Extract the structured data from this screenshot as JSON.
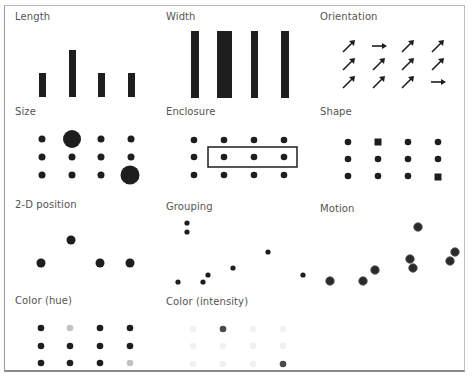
{
  "panels": [
    {
      "id": "length",
      "title": "Length",
      "title_pos": [
        15,
        11
      ]
    },
    {
      "id": "width",
      "title": "Width",
      "title_pos": [
        166,
        11
      ]
    },
    {
      "id": "orientation",
      "title": "Orientation",
      "title_pos": [
        320,
        11
      ]
    },
    {
      "id": "size",
      "title": "Size",
      "title_pos": [
        15,
        106
      ]
    },
    {
      "id": "enclosure",
      "title": "Enclosure",
      "title_pos": [
        166,
        106
      ]
    },
    {
      "id": "shape",
      "title": "Shape",
      "title_pos": [
        320,
        106
      ]
    },
    {
      "id": "position",
      "title": "2-D position",
      "title_pos": [
        15,
        199
      ]
    },
    {
      "id": "grouping",
      "title": "Grouping",
      "title_pos": [
        166,
        201
      ]
    },
    {
      "id": "motion",
      "title": "Motion",
      "title_pos": [
        320,
        203
      ]
    },
    {
      "id": "color-hue",
      "title": "Color (hue)",
      "title_pos": [
        15,
        295
      ]
    },
    {
      "id": "color-intensity",
      "title": "Color (intensity)",
      "title_pos": [
        166,
        296
      ]
    }
  ],
  "colors": {
    "mark": "#1e1e1e",
    "hue_light": "#c2c2c2",
    "intensity_faint": "#f1f1f1",
    "intensity_dark": "#4a4a4a",
    "border": "#9a9a9a"
  },
  "marks": {
    "length_bars": [
      {
        "x": 39,
        "y": 73,
        "w": 7,
        "h": 24
      },
      {
        "x": 69,
        "y": 50,
        "w": 7,
        "h": 47
      },
      {
        "x": 98,
        "y": 73,
        "w": 7,
        "h": 24
      },
      {
        "x": 128,
        "y": 73,
        "w": 7,
        "h": 24
      }
    ],
    "width_bars": [
      {
        "x": 191,
        "y": 31,
        "w": 8,
        "h": 67
      },
      {
        "x": 217,
        "y": 31,
        "w": 15,
        "h": 67
      },
      {
        "x": 251,
        "y": 31,
        "w": 7,
        "h": 67
      },
      {
        "x": 281,
        "y": 31,
        "w": 8,
        "h": 67
      }
    ],
    "orientation_arrows": [
      {
        "cx": 349,
        "cy": 46,
        "dir": "diag"
      },
      {
        "cx": 379,
        "cy": 46,
        "dir": "right"
      },
      {
        "cx": 408,
        "cy": 46,
        "dir": "diag"
      },
      {
        "cx": 438,
        "cy": 46,
        "dir": "diag"
      },
      {
        "cx": 349,
        "cy": 64,
        "dir": "diag"
      },
      {
        "cx": 379,
        "cy": 64,
        "dir": "diag"
      },
      {
        "cx": 408,
        "cy": 64,
        "dir": "diag"
      },
      {
        "cx": 438,
        "cy": 64,
        "dir": "diag"
      },
      {
        "cx": 349,
        "cy": 82,
        "dir": "diag"
      },
      {
        "cx": 379,
        "cy": 82,
        "dir": "diag"
      },
      {
        "cx": 408,
        "cy": 82,
        "dir": "diag"
      },
      {
        "cx": 438,
        "cy": 82,
        "dir": "right"
      }
    ],
    "size_dots": [
      {
        "cx": 42,
        "cy": 139,
        "r": 3.5
      },
      {
        "cx": 72,
        "cy": 139,
        "r": 9
      },
      {
        "cx": 101,
        "cy": 139,
        "r": 3.5
      },
      {
        "cx": 131,
        "cy": 139,
        "r": 3.5
      },
      {
        "cx": 42,
        "cy": 157,
        "r": 3.5
      },
      {
        "cx": 72,
        "cy": 157,
        "r": 3.5
      },
      {
        "cx": 101,
        "cy": 157,
        "r": 3.5
      },
      {
        "cx": 131,
        "cy": 157,
        "r": 3.5
      },
      {
        "cx": 42,
        "cy": 175,
        "r": 3.5
      },
      {
        "cx": 72,
        "cy": 175,
        "r": 3.5
      },
      {
        "cx": 101,
        "cy": 175,
        "r": 3.5
      },
      {
        "cx": 130,
        "cy": 175,
        "r": 9.5
      }
    ],
    "enclosure_dots": [
      {
        "cx": 194,
        "cy": 140
      },
      {
        "cx": 224,
        "cy": 140
      },
      {
        "cx": 254,
        "cy": 140
      },
      {
        "cx": 284,
        "cy": 140
      },
      {
        "cx": 194,
        "cy": 157
      },
      {
        "cx": 224,
        "cy": 157
      },
      {
        "cx": 254,
        "cy": 157
      },
      {
        "cx": 284,
        "cy": 157
      },
      {
        "cx": 194,
        "cy": 175
      },
      {
        "cx": 224,
        "cy": 175
      },
      {
        "cx": 254,
        "cy": 175
      },
      {
        "cx": 284,
        "cy": 175
      }
    ],
    "enclosure_box": {
      "x": 208,
      "y": 147,
      "w": 89,
      "h": 20
    },
    "shape_marks": [
      {
        "cx": 348,
        "cy": 142,
        "shape": "circle"
      },
      {
        "cx": 378,
        "cy": 142,
        "shape": "square"
      },
      {
        "cx": 408,
        "cy": 142,
        "shape": "circle"
      },
      {
        "cx": 438,
        "cy": 142,
        "shape": "circle"
      },
      {
        "cx": 348,
        "cy": 159,
        "shape": "circle"
      },
      {
        "cx": 378,
        "cy": 159,
        "shape": "circle"
      },
      {
        "cx": 408,
        "cy": 159,
        "shape": "circle"
      },
      {
        "cx": 438,
        "cy": 159,
        "shape": "circle"
      },
      {
        "cx": 348,
        "cy": 176,
        "shape": "circle"
      },
      {
        "cx": 378,
        "cy": 176,
        "shape": "circle"
      },
      {
        "cx": 408,
        "cy": 176,
        "shape": "circle"
      },
      {
        "cx": 438,
        "cy": 177,
        "shape": "square"
      }
    ],
    "position_dots": [
      {
        "cx": 41,
        "cy": 263
      },
      {
        "cx": 71,
        "cy": 240
      },
      {
        "cx": 100,
        "cy": 263
      },
      {
        "cx": 130,
        "cy": 263
      }
    ],
    "grouping_dots": [
      {
        "cx": 187,
        "cy": 223
      },
      {
        "cx": 187,
        "cy": 232
      },
      {
        "cx": 178,
        "cy": 282
      },
      {
        "cx": 203,
        "cy": 282
      },
      {
        "cx": 208,
        "cy": 275
      },
      {
        "cx": 233,
        "cy": 268
      },
      {
        "cx": 268,
        "cy": 252
      },
      {
        "cx": 303,
        "cy": 275
      }
    ],
    "motion_dots": [
      {
        "cx": 330,
        "cy": 281
      },
      {
        "cx": 363,
        "cy": 281
      },
      {
        "cx": 375,
        "cy": 270
      },
      {
        "cx": 418,
        "cy": 227
      },
      {
        "cx": 410,
        "cy": 259
      },
      {
        "cx": 413,
        "cy": 268
      },
      {
        "cx": 450,
        "cy": 261
      },
      {
        "cx": 455,
        "cy": 252
      }
    ],
    "hue_dots": [
      {
        "cx": 41,
        "cy": 328,
        "c": "mark"
      },
      {
        "cx": 70,
        "cy": 328,
        "c": "hue_light"
      },
      {
        "cx": 100,
        "cy": 328,
        "c": "mark"
      },
      {
        "cx": 130,
        "cy": 328,
        "c": "mark"
      },
      {
        "cx": 41,
        "cy": 346,
        "c": "mark"
      },
      {
        "cx": 70,
        "cy": 346,
        "c": "mark"
      },
      {
        "cx": 100,
        "cy": 346,
        "c": "mark"
      },
      {
        "cx": 130,
        "cy": 346,
        "c": "mark"
      },
      {
        "cx": 41,
        "cy": 363,
        "c": "mark"
      },
      {
        "cx": 70,
        "cy": 363,
        "c": "mark"
      },
      {
        "cx": 100,
        "cy": 363,
        "c": "mark"
      },
      {
        "cx": 130,
        "cy": 363,
        "c": "hue_light"
      }
    ],
    "intensity_dots": [
      {
        "cx": 193,
        "cy": 329,
        "c": "intensity_faint"
      },
      {
        "cx": 223,
        "cy": 329,
        "c": "intensity_dark"
      },
      {
        "cx": 253,
        "cy": 329,
        "c": "intensity_faint"
      },
      {
        "cx": 283,
        "cy": 329,
        "c": "intensity_faint"
      },
      {
        "cx": 193,
        "cy": 346,
        "c": "intensity_faint"
      },
      {
        "cx": 223,
        "cy": 346,
        "c": "intensity_faint"
      },
      {
        "cx": 253,
        "cy": 346,
        "c": "intensity_faint"
      },
      {
        "cx": 283,
        "cy": 346,
        "c": "intensity_faint"
      },
      {
        "cx": 193,
        "cy": 364,
        "c": "intensity_faint"
      },
      {
        "cx": 223,
        "cy": 364,
        "c": "intensity_faint"
      },
      {
        "cx": 253,
        "cy": 364,
        "c": "intensity_faint"
      },
      {
        "cx": 283,
        "cy": 364,
        "c": "intensity_dark"
      }
    ]
  }
}
